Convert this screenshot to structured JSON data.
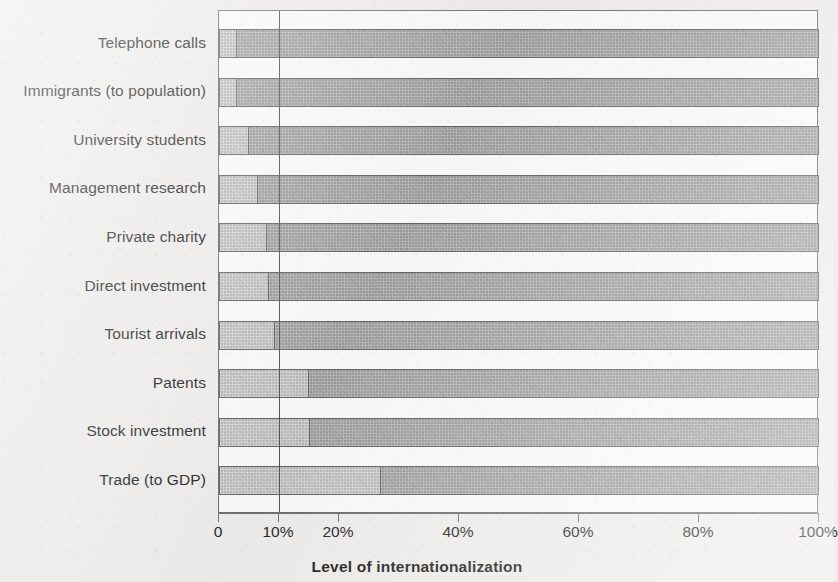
{
  "chart_data": {
    "type": "bar",
    "orientation": "horizontal",
    "stacked": true,
    "title": "",
    "xlabel": "Level of internationalization",
    "ylabel": "",
    "xlim": [
      0,
      100
    ],
    "x_unit": "%",
    "grid": false,
    "legend": null,
    "reference_line": {
      "value": 10,
      "label": "10%"
    },
    "tick_values": [
      0,
      10,
      20,
      40,
      60,
      80,
      100
    ],
    "tick_labels": [
      "0",
      "10%",
      "20%",
      "40%",
      "60%",
      "80%",
      "100%"
    ],
    "categories": [
      "Telephone calls",
      "Immigrants (to population)",
      "University students",
      "Management research",
      "Private charity",
      "Direct investment",
      "Tourist arrivals",
      "Patents",
      "Stock investment",
      "Trade (to GDP)"
    ],
    "series": [
      {
        "name": "international share",
        "values": [
          3,
          3,
          5,
          6.5,
          8,
          8.3,
          9.3,
          15,
          15.2,
          27
        ]
      },
      {
        "name": "domestic share",
        "values": [
          97,
          97,
          95,
          93.5,
          92,
          91.7,
          90.7,
          85,
          84.8,
          73
        ]
      }
    ]
  },
  "axis": {
    "x_title": "Level of internationalization"
  },
  "colors": {
    "segment_light": "#bcbcba",
    "segment_dark": "#9d9d9b",
    "outline": "#646464",
    "axis": "#6f6f6f",
    "reference_line": "#555555",
    "text": "#262626",
    "page_background": "#efeeec",
    "plot_background": "#fbfbfa"
  }
}
